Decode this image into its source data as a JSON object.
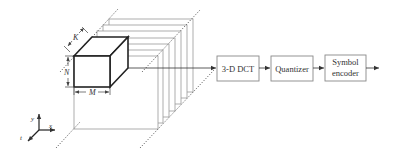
{
  "figure": {
    "type": "3-D DCT video compression block diagram",
    "cube": {
      "dimension_labels": {
        "width": "M",
        "height": "N",
        "depth": "K"
      }
    },
    "axes": {
      "x_label": "x",
      "y_label": "y",
      "t_label": "t"
    },
    "frames": {
      "count": 7
    },
    "blocks": [
      {
        "id": "dct",
        "label_lines": [
          "3-D DCT"
        ]
      },
      {
        "id": "quantizer",
        "label_lines": [
          "Quantizer"
        ]
      },
      {
        "id": "symbol_encoder",
        "label_lines": [
          "Symbol",
          "encoder"
        ]
      }
    ],
    "colors": {
      "stroke": "#555555",
      "frame_stroke": "#9a9a9a",
      "cube_stroke": "#222222",
      "text": "#333333"
    }
  }
}
